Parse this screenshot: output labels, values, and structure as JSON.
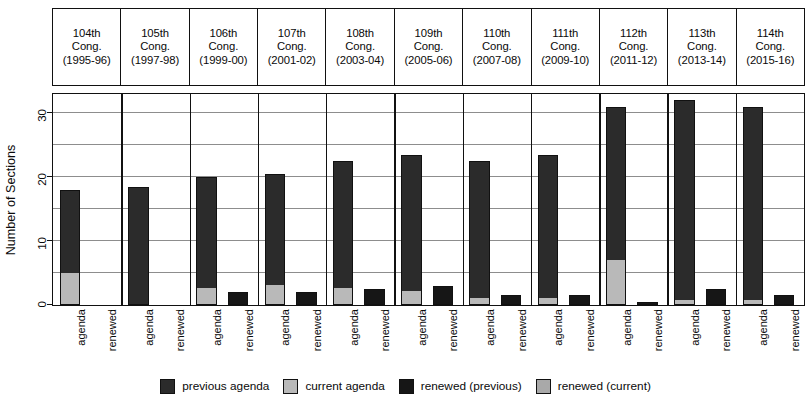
{
  "chart_data": {
    "type": "bar",
    "subtype": "grouped-stacked",
    "title": "",
    "xlabel": "",
    "ylabel": "Number of Sections",
    "ylim": [
      0,
      33
    ],
    "yticks": [
      0,
      10,
      20,
      30
    ],
    "grid": true,
    "legend_position": "bottom",
    "categories": [
      "104th Cong. (1995-96)",
      "105th Cong. (1997-98)",
      "106th Cong. (1999-00)",
      "107th Cong. (2001-02)",
      "108th Cong. (2003-04)",
      "109th Cong. (2005-06)",
      "110th Cong. (2007-08)",
      "111th Cong. (2009-10)",
      "112th Cong. (2011-12)",
      "113th Cong. (2013-14)",
      "114th Cong. (2015-16)"
    ],
    "group_tick_labels": [
      "agenda",
      "renewed"
    ],
    "series": [
      {
        "name": "previous agenda",
        "bar": "agenda",
        "color": "#2b2b2b",
        "values": [
          13,
          18.5,
          17.5,
          17.5,
          20,
          21.5,
          21.5,
          22.5,
          24,
          31.3,
          30.3
        ]
      },
      {
        "name": "current agenda",
        "bar": "agenda",
        "color": "#b9b9b9",
        "values": [
          5,
          0,
          2.5,
          3,
          2.5,
          2,
          1,
          1,
          7,
          0.7,
          0.7
        ]
      },
      {
        "name": "renewed (previous)",
        "bar": "renewed",
        "color": "#161616",
        "values": [
          0,
          0,
          2,
          2,
          2.5,
          3,
          1.5,
          1.5,
          0.5,
          2.5,
          1.5
        ]
      },
      {
        "name": "renewed (current)",
        "bar": "renewed",
        "color": "#a9a9a9",
        "values": [
          0,
          0,
          0,
          0,
          0,
          0,
          0,
          0,
          0,
          0,
          0
        ]
      }
    ],
    "agenda_totals": [
      18,
      18.5,
      20,
      20.5,
      22.5,
      23.5,
      22.5,
      23.5,
      31,
      32,
      31
    ],
    "renewed_totals": [
      0,
      0,
      2,
      2,
      2.5,
      3,
      1.5,
      1.5,
      0.5,
      2.5,
      1.5
    ]
  },
  "header": {
    "columns": [
      {
        "congress": "104th",
        "word": "Cong.",
        "years": "(1995-96)"
      },
      {
        "congress": "105th",
        "word": "Cong.",
        "years": "(1997-98)"
      },
      {
        "congress": "106th",
        "word": "Cong.",
        "years": "(1999-00)"
      },
      {
        "congress": "107th",
        "word": "Cong.",
        "years": "(2001-02)"
      },
      {
        "congress": "108th",
        "word": "Cong.",
        "years": "(2003-04)"
      },
      {
        "congress": "109th",
        "word": "Cong.",
        "years": "(2005-06)"
      },
      {
        "congress": "110th",
        "word": "Cong.",
        "years": "(2007-08)"
      },
      {
        "congress": "111th",
        "word": "Cong.",
        "years": "(2009-10)"
      },
      {
        "congress": "112th",
        "word": "Cong.",
        "years": "(2011-12)"
      },
      {
        "congress": "113th",
        "word": "Cong.",
        "years": "(2013-14)"
      },
      {
        "congress": "114th",
        "word": "Cong.",
        "years": "(2015-16)"
      }
    ]
  },
  "yaxis": {
    "title": "Number of Sections",
    "ticks": [
      "0",
      "10",
      "20",
      "30"
    ]
  },
  "legend": {
    "items": [
      {
        "label": "previous agenda",
        "color": "#2b2b2b"
      },
      {
        "label": "current agenda",
        "color": "#b9b9b9"
      },
      {
        "label": "renewed (previous)",
        "color": "#161616"
      },
      {
        "label": "renewed (current)",
        "color": "#a9a9a9"
      }
    ]
  }
}
